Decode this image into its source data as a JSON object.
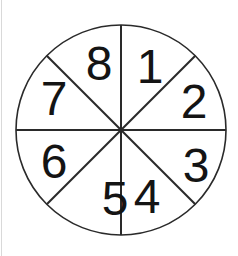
{
  "figure": {
    "type": "spinner-wheel",
    "sector_count": 8,
    "sectors": [
      {
        "position": "top-right",
        "label": "1"
      },
      {
        "position": "right-upper",
        "label": "2"
      },
      {
        "position": "right-lower",
        "label": "3"
      },
      {
        "position": "bottom-right",
        "label": "4"
      },
      {
        "position": "bottom-left",
        "label": "5"
      },
      {
        "position": "left-lower",
        "label": "6"
      },
      {
        "position": "left-upper",
        "label": "7"
      },
      {
        "position": "top-left",
        "label": "8"
      }
    ],
    "colors": {
      "line": "#2a2a2a",
      "text": "#141414",
      "background": "#ffffff"
    }
  }
}
